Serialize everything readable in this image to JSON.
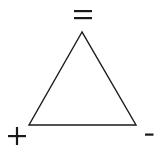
{
  "diagram": {
    "type": "triangle",
    "stroke_color": "#1a1a1a",
    "background": "#ffffff",
    "vertices": [
      {
        "position": "top",
        "symbol": "=",
        "name": "equal"
      },
      {
        "position": "bottom-left",
        "symbol": "+",
        "name": "plus"
      },
      {
        "position": "bottom-right",
        "symbol": "-",
        "name": "minus"
      }
    ]
  }
}
